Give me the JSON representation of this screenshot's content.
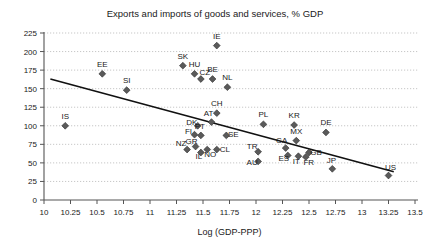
{
  "chart_data": {
    "type": "scatter",
    "title": "Exports and imports of goods and services, % GDP",
    "xlabel": "Log (GDP-PPP)",
    "ylabel": "",
    "xlim": [
      10,
      13.5
    ],
    "ylim": [
      0,
      225
    ],
    "xticks": [
      "10",
      "10.25",
      "10.5",
      "10.75",
      "11",
      "11.25",
      "11.5",
      "11.75",
      "12",
      "12.25",
      "12.5",
      "12.75",
      "13",
      "13.25",
      "13.5"
    ],
    "xtick_values": [
      10,
      10.25,
      10.5,
      10.75,
      11,
      11.25,
      11.5,
      11.75,
      12,
      12.25,
      12.5,
      12.75,
      13,
      13.25,
      13.5
    ],
    "yticks": [
      "0",
      "25",
      "50",
      "75",
      "100",
      "125",
      "150",
      "175",
      "200",
      "225"
    ],
    "ytick_values": [
      0,
      25,
      50,
      75,
      100,
      125,
      150,
      175,
      200,
      225
    ],
    "grid": true,
    "legend": "none",
    "marker_color": "#5a5a5a",
    "trendline_color": "#111111",
    "trendline": {
      "x_start": 10.06,
      "y_start": 163,
      "x_end": 13.3,
      "y_end": 38
    },
    "points": [
      {
        "label": "IE",
        "x": 11.63,
        "y": 208,
        "label_dx": 0,
        "label_dy": -7
      },
      {
        "label": "SK",
        "x": 11.31,
        "y": 181,
        "label_dx": 0,
        "label_dy": -7
      },
      {
        "label": "HU",
        "x": 11.42,
        "y": 170,
        "label_dx": 0,
        "label_dy": -7
      },
      {
        "label": "CZ",
        "x": 11.48,
        "y": 163,
        "label_dx": 4,
        "label_dy": -4
      },
      {
        "label": "BE",
        "x": 11.59,
        "y": 163,
        "label_dx": 0,
        "label_dy": -7
      },
      {
        "label": "NL",
        "x": 11.73,
        "y": 152,
        "label_dx": 0,
        "label_dy": -7
      },
      {
        "label": "EE",
        "x": 10.55,
        "y": 170,
        "label_dx": 0,
        "label_dy": -7
      },
      {
        "label": "SI",
        "x": 10.78,
        "y": 148,
        "label_dx": 0,
        "label_dy": -7
      },
      {
        "label": "IS",
        "x": 10.2,
        "y": 100,
        "label_dx": 0,
        "label_dy": -7
      },
      {
        "label": "CH",
        "x": 11.63,
        "y": 117,
        "label_dx": 0,
        "label_dy": -7
      },
      {
        "label": "AT",
        "x": 11.58,
        "y": 105,
        "label_dx": -3,
        "label_dy": -6
      },
      {
        "label": "DK",
        "x": 11.45,
        "y": 100,
        "label_dx": -6,
        "label_dy": -1
      },
      {
        "label": "PL",
        "x": 12.07,
        "y": 102,
        "label_dx": 0,
        "label_dy": -7
      },
      {
        "label": "KR",
        "x": 12.36,
        "y": 101,
        "label_dx": 0,
        "label_dy": -7
      },
      {
        "label": "DE",
        "x": 12.66,
        "y": 91,
        "label_dx": 0,
        "label_dy": -7
      },
      {
        "label": "MX",
        "x": 12.38,
        "y": 80,
        "label_dx": 0,
        "label_dy": -7
      },
      {
        "label": "FI",
        "x": 11.42,
        "y": 88,
        "label_dx": -6,
        "label_dy": -1
      },
      {
        "label": "PT",
        "x": 11.48,
        "y": 87,
        "label_dx": -1,
        "label_dy": -6
      },
      {
        "label": "SE",
        "x": 11.72,
        "y": 87,
        "label_dx": 7,
        "label_dy": 2
      },
      {
        "label": "NZ",
        "x": 11.35,
        "y": 68,
        "label_dx": -6,
        "label_dy": -4
      },
      {
        "label": "GR",
        "x": 11.43,
        "y": 72,
        "label_dx": -4,
        "label_dy": -3
      },
      {
        "label": "IL",
        "x": 11.48,
        "y": 64,
        "label_dx": -2,
        "label_dy": 7
      },
      {
        "label": "NO",
        "x": 11.54,
        "y": 68,
        "label_dx": 3,
        "label_dy": 7
      },
      {
        "label": "CL",
        "x": 11.63,
        "y": 68,
        "label_dx": 8,
        "label_dy": 2
      },
      {
        "label": "TR",
        "x": 12.02,
        "y": 65,
        "label_dx": -6,
        "label_dy": -3
      },
      {
        "label": "AU",
        "x": 12.02,
        "y": 52,
        "label_dx": -6,
        "label_dy": 4
      },
      {
        "label": "CA",
        "x": 12.28,
        "y": 70,
        "label_dx": -4,
        "label_dy": -5
      },
      {
        "label": "ES",
        "x": 12.3,
        "y": 60,
        "label_dx": -4,
        "label_dy": 6
      },
      {
        "label": "IT",
        "x": 12.4,
        "y": 59,
        "label_dx": -2,
        "label_dy": 8
      },
      {
        "label": "FR",
        "x": 12.47,
        "y": 58,
        "label_dx": 3,
        "label_dy": 8
      },
      {
        "label": "GB",
        "x": 12.5,
        "y": 64,
        "label_dx": 7,
        "label_dy": 3
      },
      {
        "label": "JP",
        "x": 12.72,
        "y": 42,
        "label_dx": -1,
        "label_dy": -6
      },
      {
        "label": "US",
        "x": 13.25,
        "y": 33,
        "label_dx": 2,
        "label_dy": -6
      }
    ]
  }
}
